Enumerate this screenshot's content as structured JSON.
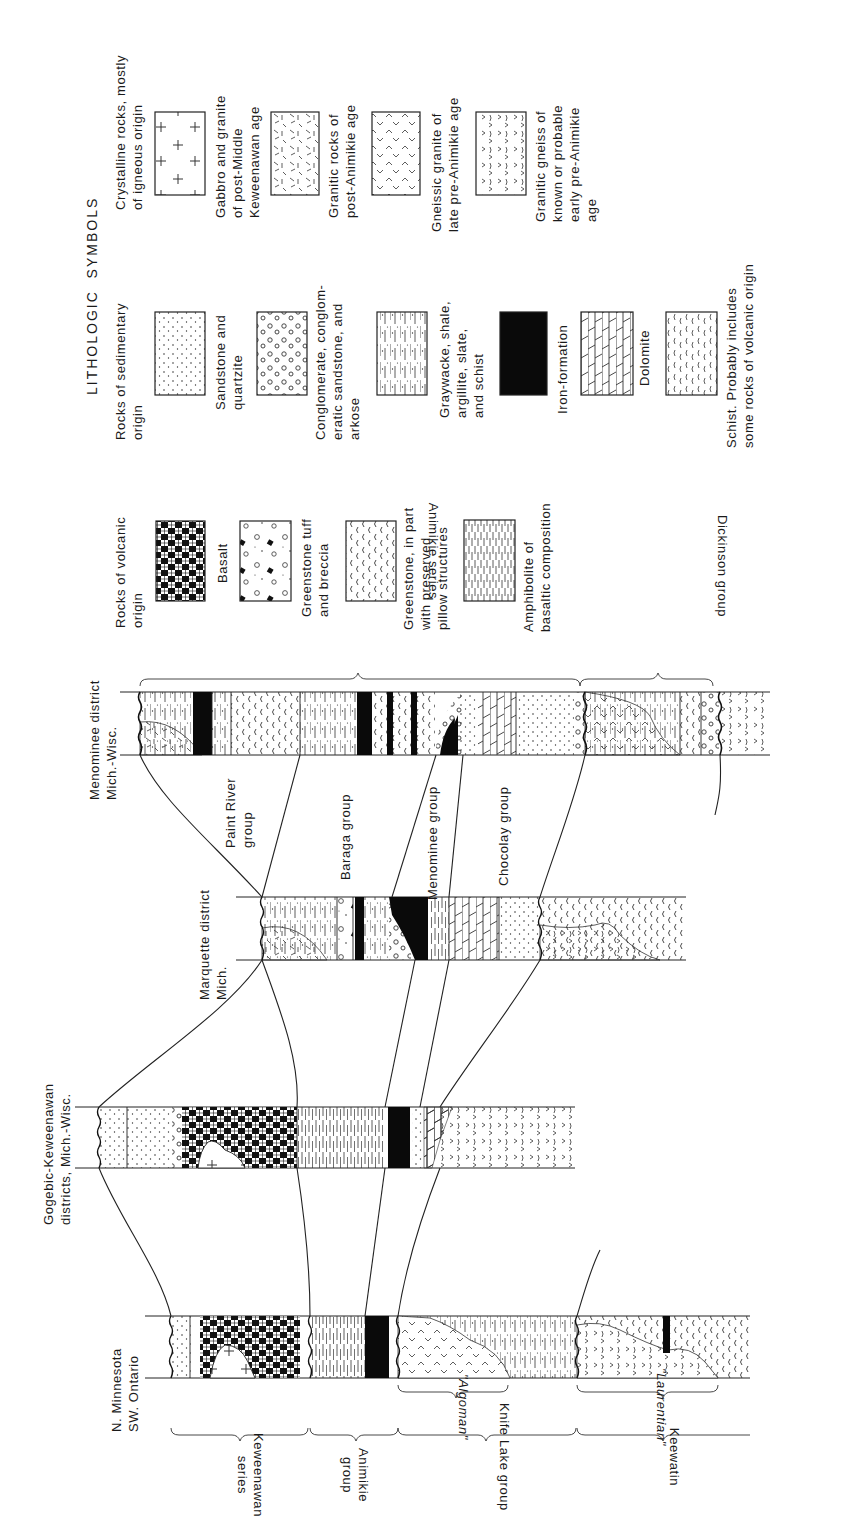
{
  "legend": {
    "title": "LITHOLOGIC  SYMBOLS",
    "groups": [
      {
        "heading": "Crystalline rocks, mostly\nof igneous origin",
        "items": [
          {
            "label": "Gabbro and granite\nof post-Middle\nKeweenawan age",
            "pattern": "crosses"
          },
          {
            "label": "Granitic rocks of\npost-Animikie age",
            "pattern": "dashes"
          },
          {
            "label": "Gneissic granite of\nlate pre-Animikie age",
            "pattern": "carets"
          },
          {
            "label": "Granitic gneiss of\nknown or probable\nearly pre-Animikie\nage",
            "pattern": "gneiss"
          }
        ]
      },
      {
        "heading": "Rocks of sedimentary\norigin",
        "items": [
          {
            "label": "Sandstone and\nquartzite",
            "pattern": "dots"
          },
          {
            "label": "Conglomerate, conglom-\neratic sandstone, and\narkose",
            "pattern": "circles"
          },
          {
            "label": "Graywacke, shale,\nargillite, slate,\nand schist",
            "pattern": "lines-dots"
          },
          {
            "label": "Iron-formation",
            "pattern": "solid-black"
          },
          {
            "label": "Dolomite",
            "pattern": "bricks"
          },
          {
            "label": "Schist. Probably includes\nsome rocks of volcanic origin",
            "pattern": "wavy"
          }
        ]
      },
      {
        "heading": "Rocks of volcanic\norigin",
        "items": [
          {
            "label": "Basalt",
            "pattern": "checker"
          },
          {
            "label": "Greenstone tuff\nand breccia",
            "pattern": "breccia"
          },
          {
            "label": "Greenstone, in part\nwith preserved\npillow structures",
            "pattern": "pillows"
          },
          {
            "label": "Amphibolite of\nbasaltic composition",
            "pattern": "amphibolite"
          }
        ]
      }
    ]
  },
  "columns": [
    {
      "id": "menominee",
      "label": "Menominee district\nMich.-Wisc."
    },
    {
      "id": "marquette",
      "label": "Marquette district\nMich."
    },
    {
      "id": "gogebic",
      "label": "Gogebic-Keweenawan\ndistricts, Mich.-Wisc."
    },
    {
      "id": "minnesota",
      "label": "N. Minnesota\nSW. Ontario"
    }
  ],
  "group_labels": {
    "paint_river": "Paint River\ngroup",
    "baraga": "Baraga group",
    "menominee": "Menominee group",
    "chocolay": "Chocolay group"
  },
  "upper_brackets": {
    "animikie_series": "Animikie series",
    "dickinson_group": "Dickinson group"
  },
  "lower_brackets": {
    "algoman": "\"Algoman\"",
    "laurentian": "\"Laurentian\"",
    "keweenawan_series": "Keweenawan\nseries",
    "animikie_group": "Animikie\ngroup",
    "knife_lake_group": "Knife Lake group",
    "keewatin": "Keewatin"
  }
}
